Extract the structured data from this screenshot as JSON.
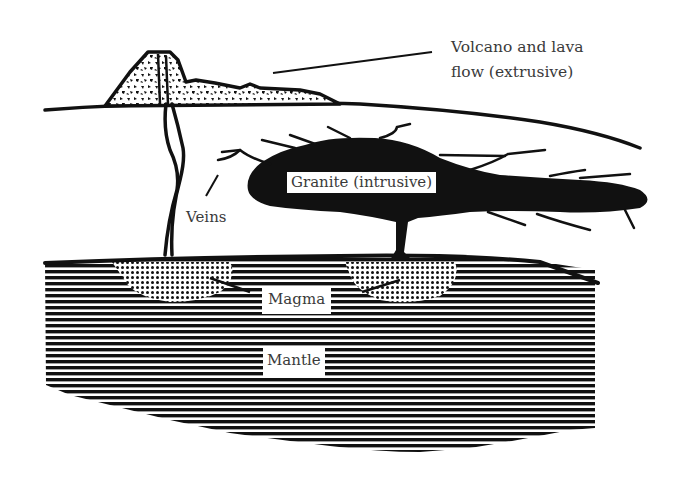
{
  "diagram": {
    "type": "geological cross-section",
    "labels": {
      "volcano_line1": "Volcano and lava",
      "volcano_line2": "flow (extrusive)",
      "granite": "Granite (intrusive)",
      "veins": "Veins",
      "magma": "Magma",
      "mantle": "Mantle"
    },
    "colors": {
      "ink": "#111111",
      "label_text": "#3a3a3a",
      "background": "#ffffff"
    }
  }
}
